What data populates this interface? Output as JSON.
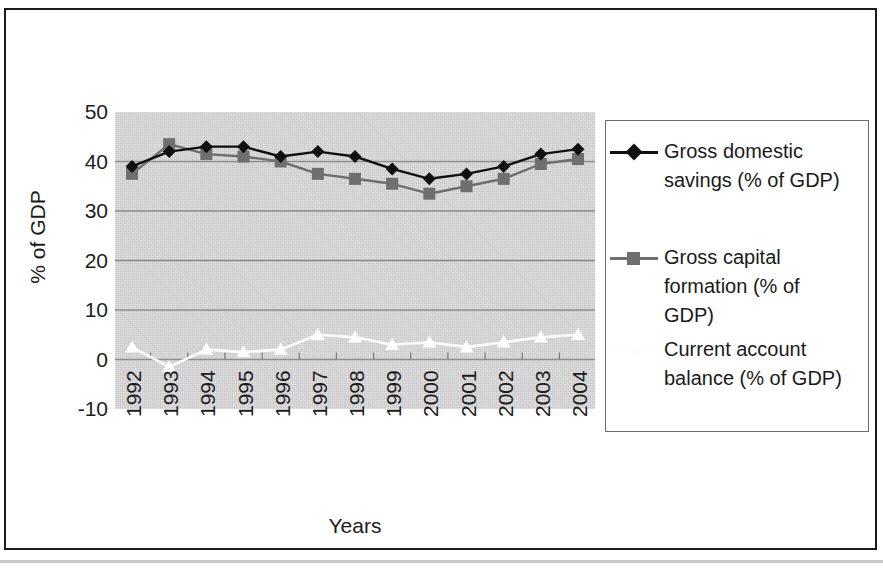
{
  "figure": {
    "x_axis_title": "Years",
    "y_axis_title": "% of GDP"
  },
  "axis": {
    "y_ticks": [
      "50",
      "40",
      "30",
      "20",
      "10",
      "0",
      "-10"
    ],
    "x_ticks": [
      "1992",
      "1993",
      "1994",
      "1995",
      "1996",
      "1997",
      "1998",
      "1999",
      "2000",
      "2001",
      "2002",
      "2003",
      "2004"
    ]
  },
  "legend": {
    "entries": [
      {
        "label": "Gross domestic savings (% of GDP)",
        "marker": "diamond-marker",
        "color": "#101010"
      },
      {
        "label": "Gross capital formation (% of GDP)",
        "marker": "square-marker",
        "color": "#6f6f6f"
      },
      {
        "label": "Current account balance (% of GDP)",
        "marker": "triangle-marker",
        "color": "#fefefe"
      }
    ]
  },
  "colors": {
    "plot_background": "#d4d4d4",
    "gridline": "#8d8d8d",
    "frame": "#1b1b1b",
    "series_1": "#101010",
    "series_2": "#6f6f6f",
    "series_3": "#fefefe"
  },
  "chart_data": {
    "type": "line",
    "title": "",
    "xlabel": "Years",
    "ylabel": "% of GDP",
    "x": [
      "1992",
      "1993",
      "1994",
      "1995",
      "1996",
      "1997",
      "1998",
      "1999",
      "2000",
      "2001",
      "2002",
      "2003",
      "2004"
    ],
    "categories": [
      "1992",
      "1993",
      "1994",
      "1995",
      "1996",
      "1997",
      "1998",
      "1999",
      "2000",
      "2001",
      "2002",
      "2003",
      "2004"
    ],
    "ylim": [
      -10,
      50
    ],
    "ytick_step": 10,
    "grid": true,
    "legend_position": "right",
    "series": [
      {
        "name": "Gross domestic savings (% of GDP)",
        "marker": "diamond",
        "color": "#101010",
        "values": [
          39.0,
          42.0,
          43.0,
          43.0,
          41.0,
          42.0,
          41.0,
          38.5,
          36.5,
          37.5,
          39.0,
          41.5,
          42.5
        ]
      },
      {
        "name": "Gross capital formation (% of GDP)",
        "marker": "square",
        "color": "#6f6f6f",
        "values": [
          37.5,
          43.5,
          41.5,
          41.0,
          40.0,
          37.5,
          36.5,
          35.5,
          33.5,
          35.0,
          36.5,
          39.5,
          40.5
        ]
      },
      {
        "name": "Current account balance (% of GDP)",
        "marker": "triangle",
        "color": "#fefefe",
        "values": [
          2.5,
          -1.5,
          2.0,
          1.5,
          2.0,
          5.0,
          4.5,
          3.0,
          3.5,
          2.5,
          3.5,
          4.5,
          5.0
        ]
      }
    ]
  }
}
